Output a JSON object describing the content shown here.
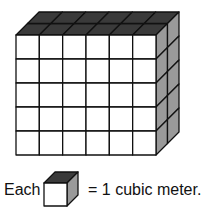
{
  "diagram": {
    "type": "rectangular prism of unit cubes",
    "dimensions": {
      "length": 6,
      "height": 5,
      "depth": 2
    },
    "colors": {
      "front": "#ffffff",
      "top": "#3a3a3a",
      "side": "#9a9a9a",
      "stroke": "#111111"
    }
  },
  "legend": {
    "prefix": "Each",
    "suffix": "= 1 cubic meter."
  }
}
